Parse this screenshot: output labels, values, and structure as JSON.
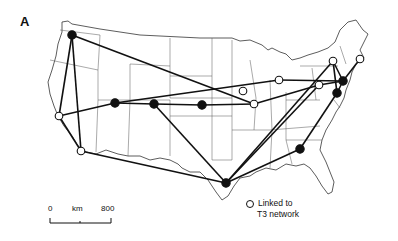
{
  "figure": {
    "panel_label": "A",
    "legend": {
      "open_circle_label_line1": "Linked to",
      "open_circle_label_line2": "T3 network"
    },
    "scale_bar": {
      "start": "0",
      "unit": "km",
      "end": "800"
    },
    "colors": {
      "ink": "#111111",
      "borders": "#333333",
      "background": "#ffffff"
    }
  },
  "nodes": [
    {
      "id": "seattle",
      "x": 72,
      "y": 35,
      "type": "filled"
    },
    {
      "id": "palo-alto",
      "x": 59,
      "y": 116,
      "type": "open"
    },
    {
      "id": "san-diego",
      "x": 81,
      "y": 151,
      "type": "open"
    },
    {
      "id": "salt-lake",
      "x": 115,
      "y": 103,
      "type": "filled"
    },
    {
      "id": "boulder",
      "x": 154,
      "y": 104,
      "type": "filled"
    },
    {
      "id": "lincoln",
      "x": 202,
      "y": 105,
      "type": "filled"
    },
    {
      "id": "houston",
      "x": 226,
      "y": 183,
      "type": "filled"
    },
    {
      "id": "chicago",
      "x": 243,
      "y": 91,
      "type": "open"
    },
    {
      "id": "urbana",
      "x": 254,
      "y": 104,
      "type": "open"
    },
    {
      "id": "ann-arbor",
      "x": 279,
      "y": 80,
      "type": "open"
    },
    {
      "id": "pittsburgh",
      "x": 319,
      "y": 85,
      "type": "open"
    },
    {
      "id": "ithaca",
      "x": 333,
      "y": 61,
      "type": "open"
    },
    {
      "id": "boston",
      "x": 360,
      "y": 59,
      "type": "open"
    },
    {
      "id": "princeton",
      "x": 343,
      "y": 81,
      "type": "filled"
    },
    {
      "id": "college-park",
      "x": 337,
      "y": 93,
      "type": "filled"
    },
    {
      "id": "atlanta",
      "x": 300,
      "y": 149,
      "type": "filled"
    }
  ],
  "links": [
    [
      "seattle",
      "palo-alto"
    ],
    [
      "seattle",
      "san-diego"
    ],
    [
      "seattle",
      "urbana"
    ],
    [
      "palo-alto",
      "salt-lake"
    ],
    [
      "palo-alto",
      "san-diego"
    ],
    [
      "san-diego",
      "houston"
    ],
    [
      "salt-lake",
      "boulder"
    ],
    [
      "salt-lake",
      "ann-arbor"
    ],
    [
      "boulder",
      "lincoln"
    ],
    [
      "boulder",
      "houston"
    ],
    [
      "lincoln",
      "urbana"
    ],
    [
      "urbana",
      "pittsburgh"
    ],
    [
      "ann-arbor",
      "princeton"
    ],
    [
      "houston",
      "atlanta"
    ],
    [
      "houston",
      "pittsburgh"
    ],
    [
      "houston",
      "ithaca"
    ],
    [
      "atlanta",
      "college-park"
    ],
    [
      "ithaca",
      "princeton"
    ],
    [
      "ithaca",
      "college-park"
    ],
    [
      "princeton",
      "college-park"
    ],
    [
      "pittsburgh",
      "princeton"
    ],
    [
      "boston",
      "princeton"
    ]
  ]
}
